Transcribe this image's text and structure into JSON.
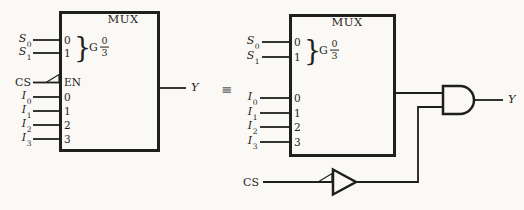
{
  "colors": {
    "background": "#faf9f5",
    "line": "#1f1f1f",
    "equiv": "#7a7a7a"
  },
  "equiv_symbol": "≡",
  "left_mux": {
    "title": "MUX",
    "brace": "}",
    "qualifier": {
      "letter": "G",
      "numerator": "0",
      "denominator": "3"
    },
    "select_inputs": [
      {
        "base": "S",
        "sub": "0",
        "pin": "0"
      },
      {
        "base": "S",
        "sub": "1",
        "pin": "1"
      }
    ],
    "enable_input": {
      "label": "CS",
      "pin": "EN"
    },
    "data_inputs": [
      {
        "base": "I",
        "sub": "0",
        "pin": "0"
      },
      {
        "base": "I",
        "sub": "1",
        "pin": "1"
      },
      {
        "base": "I",
        "sub": "2",
        "pin": "2"
      },
      {
        "base": "I",
        "sub": "3",
        "pin": "3"
      }
    ],
    "output_label": "Y"
  },
  "right_mux": {
    "title": "MUX",
    "brace": "}",
    "qualifier": {
      "letter": "G",
      "numerator": "0",
      "denominator": "3"
    },
    "select_inputs": [
      {
        "base": "S",
        "sub": "0",
        "pin": "0"
      },
      {
        "base": "S",
        "sub": "1",
        "pin": "1"
      }
    ],
    "data_inputs": [
      {
        "base": "I",
        "sub": "0",
        "pin": "0"
      },
      {
        "base": "I",
        "sub": "1",
        "pin": "1"
      },
      {
        "base": "I",
        "sub": "2",
        "pin": "2"
      },
      {
        "base": "I",
        "sub": "3",
        "pin": "3"
      }
    ],
    "enable_signal": "CS",
    "output_label": "Y"
  }
}
